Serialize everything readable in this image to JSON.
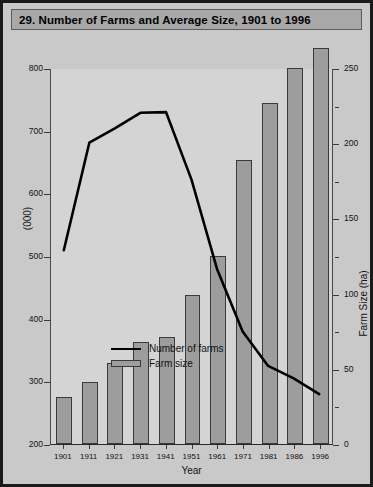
{
  "title": "29. Number of Farms and Average Size, 1901 to 1996",
  "axes": {
    "x_title": "Year",
    "y_left_title": "(000)",
    "y_right_title": "Farm Size (ha)",
    "y_left_ticks": [
      "800",
      "700",
      "600",
      "500",
      "400",
      "300",
      "200"
    ],
    "y_right_ticks": [
      "250",
      "200",
      "150",
      "100",
      "50",
      "0"
    ]
  },
  "legend": {
    "line_label": "Number of farms",
    "bar_label": "Farm size"
  },
  "colors": {
    "background": "#c9c9c9",
    "plot_background": "#d4d4d4",
    "title_bar": "#a8a8a8",
    "bar_fill": "#9d9d9d",
    "bar_outline": "#3a3a3a",
    "line": "#000000",
    "frame": "#1a1a1a"
  },
  "chart_data": {
    "type": "bar",
    "title": "29. Number of Farms and Average Size, 1901 to 1996",
    "xlabel": "Year",
    "ylabel": "(000)",
    "y2label": "Farm Size (ha)",
    "categories": [
      "1901",
      "1911",
      "1921",
      "1931",
      "1941",
      "1951",
      "1961",
      "1971",
      "1981",
      "1986",
      "1996"
    ],
    "ylim": [
      200,
      800
    ],
    "y2lim": [
      0,
      250
    ],
    "yticks": [
      200,
      300,
      400,
      500,
      600,
      700,
      800
    ],
    "y2ticks": [
      0,
      50,
      100,
      150,
      200,
      250
    ],
    "grid": false,
    "legend_position": "center-left inside plot",
    "series": [
      {
        "name": "Farm size",
        "type": "bar",
        "axis": "right",
        "unit": "ha",
        "values": [
          31,
          41,
          54,
          68,
          71,
          99,
          125,
          189,
          227,
          250,
          263
        ]
      },
      {
        "name": "Number of farms",
        "type": "line",
        "axis": "left",
        "unit": "000",
        "values": [
          510,
          682,
          705,
          730,
          731,
          623,
          480,
          380,
          325,
          305,
          280
        ]
      }
    ]
  }
}
